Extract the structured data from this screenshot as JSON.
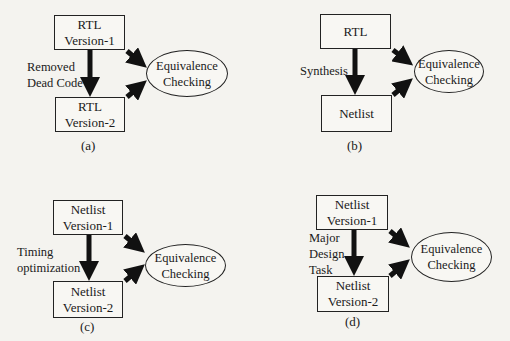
{
  "diagrams": [
    {
      "id": "a",
      "top_box": [
        "RTL",
        "Version-1"
      ],
      "bottom_box": [
        "RTL",
        "Version-2"
      ],
      "transform_label": [
        "Removed",
        "Dead Code"
      ],
      "target": [
        "Equivalence",
        "Checking"
      ],
      "caption": "(a)"
    },
    {
      "id": "b",
      "top_box": [
        "RTL"
      ],
      "bottom_box": [
        "Netlist"
      ],
      "transform_label": [
        "Synthesis"
      ],
      "target": [
        "Equivalence",
        "Checking"
      ],
      "caption": "(b)"
    },
    {
      "id": "c",
      "top_box": [
        "Netlist",
        "Version-1"
      ],
      "bottom_box": [
        "Netlist",
        "Version-2"
      ],
      "transform_label": [
        "Timing",
        "optimization"
      ],
      "target": [
        "Equivalence",
        "Checking"
      ],
      "caption": "(c)"
    },
    {
      "id": "d",
      "top_box": [
        "Netlist",
        "Version-1"
      ],
      "bottom_box": [
        "Netlist",
        "Version-2"
      ],
      "transform_label": [
        "Major",
        "Design",
        "Task"
      ],
      "target": [
        "Equivalence",
        "Checking"
      ],
      "caption": "(d)"
    }
  ],
  "colors": {
    "line": "#222222",
    "arrow": "#111111",
    "background": "#f4f3ef"
  }
}
